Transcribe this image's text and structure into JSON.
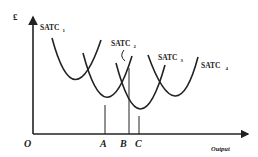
{
  "diagram": {
    "y_axis_label": "£",
    "x_axis_label": "Output",
    "origin_label": "O",
    "colors": {
      "line": "#222222",
      "background": "#ffffff"
    },
    "curves": [
      {
        "name": "SATC",
        "sub": "1"
      },
      {
        "name": "SATC",
        "sub": "2"
      },
      {
        "name": "SATC",
        "sub": "3"
      },
      {
        "name": "SATC",
        "sub": "4"
      }
    ],
    "points": [
      {
        "label": "A"
      },
      {
        "label": "B"
      },
      {
        "label": "C"
      }
    ]
  }
}
